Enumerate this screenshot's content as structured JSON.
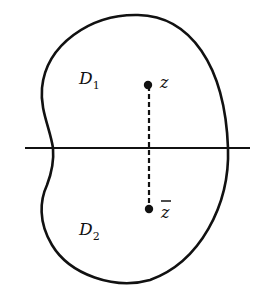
{
  "figure": {
    "regions": [
      {
        "name": "D",
        "subscript": "1"
      },
      {
        "name": "D",
        "subscript": "2"
      }
    ],
    "points": [
      {
        "label": "z"
      },
      {
        "label": "z"
      }
    ],
    "conjugate_bar": true,
    "colors": {
      "stroke": "#111111",
      "background": "#ffffff"
    }
  }
}
